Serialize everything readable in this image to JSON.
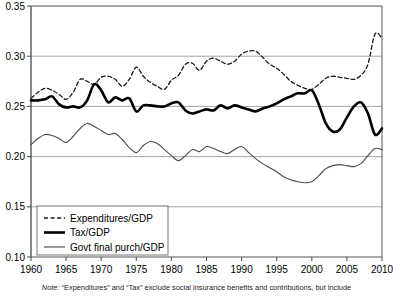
{
  "note": {
    "prefix": "Note:",
    "body": "“Expenditures” and “Tax” exclude social insurance benefits and contributions, but include"
  },
  "legend": {
    "items": [
      {
        "label": "Expenditures/GDP",
        "style": "dashed",
        "color": "#1a1a1a"
      },
      {
        "label": "Tax/GDP",
        "style": "thick-solid",
        "color": "#000000"
      },
      {
        "label": "Govt final purch/GDP",
        "style": "thin-solid",
        "color": "#4d4d4d"
      }
    ]
  },
  "axis": {
    "y_ticks": [
      "0.10",
      "0.15",
      "0.20",
      "0.25",
      "0.30",
      "0.35"
    ],
    "x_ticks": [
      "1960",
      "1965",
      "1970",
      "1975",
      "1980",
      "1985",
      "1990",
      "1995",
      "2000",
      "2005",
      "2010"
    ]
  },
  "chart_data": {
    "type": "line",
    "title": "",
    "xlabel": "",
    "ylabel": "",
    "xlim": [
      1960,
      2010
    ],
    "ylim": [
      0.1,
      0.35
    ],
    "grid": true,
    "legend_position": "bottom-left",
    "x": [
      1960,
      1961,
      1962,
      1963,
      1964,
      1965,
      1966,
      1967,
      1968,
      1969,
      1970,
      1971,
      1972,
      1973,
      1974,
      1975,
      1976,
      1977,
      1978,
      1979,
      1980,
      1981,
      1982,
      1983,
      1984,
      1985,
      1986,
      1987,
      1988,
      1989,
      1990,
      1991,
      1992,
      1993,
      1994,
      1995,
      1996,
      1997,
      1998,
      1999,
      2000,
      2001,
      2002,
      2003,
      2004,
      2005,
      2006,
      2007,
      2008,
      2009,
      2010
    ],
    "series": [
      {
        "name": "Expenditures/GDP",
        "style": "dashed",
        "values": [
          0.258,
          0.264,
          0.268,
          0.266,
          0.262,
          0.257,
          0.264,
          0.277,
          0.275,
          0.272,
          0.279,
          0.28,
          0.277,
          0.27,
          0.277,
          0.289,
          0.28,
          0.274,
          0.27,
          0.267,
          0.276,
          0.281,
          0.292,
          0.293,
          0.286,
          0.295,
          0.298,
          0.295,
          0.292,
          0.295,
          0.302,
          0.305,
          0.305,
          0.299,
          0.292,
          0.288,
          0.282,
          0.275,
          0.271,
          0.268,
          0.267,
          0.272,
          0.278,
          0.28,
          0.279,
          0.278,
          0.277,
          0.281,
          0.292,
          0.322,
          0.318
        ]
      },
      {
        "name": "Tax/GDP",
        "style": "thick-solid",
        "values": [
          0.256,
          0.256,
          0.257,
          0.26,
          0.252,
          0.249,
          0.25,
          0.249,
          0.256,
          0.272,
          0.266,
          0.254,
          0.259,
          0.256,
          0.258,
          0.245,
          0.251,
          0.251,
          0.25,
          0.25,
          0.253,
          0.254,
          0.246,
          0.243,
          0.245,
          0.247,
          0.246,
          0.251,
          0.248,
          0.251,
          0.249,
          0.247,
          0.245,
          0.248,
          0.25,
          0.253,
          0.257,
          0.26,
          0.263,
          0.263,
          0.266,
          0.252,
          0.233,
          0.225,
          0.227,
          0.239,
          0.25,
          0.254,
          0.243,
          0.222,
          0.228
        ]
      },
      {
        "name": "Govt final purch/GDP",
        "style": "thin-solid",
        "values": [
          0.212,
          0.218,
          0.222,
          0.221,
          0.218,
          0.214,
          0.22,
          0.228,
          0.233,
          0.23,
          0.226,
          0.222,
          0.223,
          0.217,
          0.209,
          0.204,
          0.211,
          0.215,
          0.213,
          0.207,
          0.201,
          0.196,
          0.201,
          0.207,
          0.205,
          0.21,
          0.208,
          0.205,
          0.203,
          0.207,
          0.21,
          0.204,
          0.198,
          0.193,
          0.189,
          0.185,
          0.18,
          0.177,
          0.175,
          0.174,
          0.175,
          0.181,
          0.188,
          0.191,
          0.192,
          0.191,
          0.19,
          0.193,
          0.201,
          0.208,
          0.207
        ]
      }
    ]
  }
}
